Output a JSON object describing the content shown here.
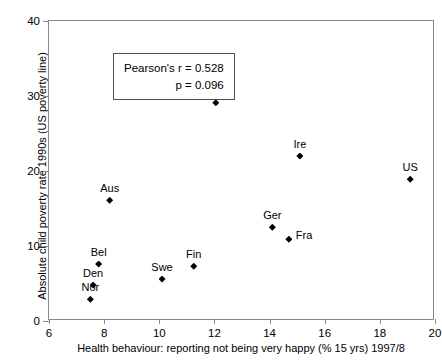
{
  "chart_data": {
    "type": "scatter",
    "title": "",
    "xlabel": "Health behaviour:  reporting not being very happy  (% 15 yrs) 1997/8",
    "ylabel": "Absolute child poverty rate 1990s (US poverty line)",
    "xlim": [
      6,
      20
    ],
    "ylim": [
      0,
      40
    ],
    "xticks": [
      6,
      8,
      10,
      12,
      14,
      16,
      18,
      20
    ],
    "yticks": [
      0,
      10,
      20,
      30,
      40
    ],
    "grid": false,
    "legend": "none",
    "marker": "diamond",
    "marker_color": "#000000",
    "points": [
      {
        "label": "Nor",
        "x": 7.5,
        "y": 2.9,
        "label_pos": "above"
      },
      {
        "label": "Den",
        "x": 7.6,
        "y": 4.8,
        "label_pos": "above"
      },
      {
        "label": "Bel",
        "x": 7.8,
        "y": 7.6,
        "label_pos": "above"
      },
      {
        "label": "Aus",
        "x": 8.2,
        "y": 16.1,
        "label_pos": "above"
      },
      {
        "label": "Swe",
        "x": 10.1,
        "y": 5.6,
        "label_pos": "above"
      },
      {
        "label": "Fin",
        "x": 11.25,
        "y": 7.3,
        "label_pos": "above"
      },
      {
        "label": "UK",
        "x": 12.05,
        "y": 29.1,
        "label_pos": "above"
      },
      {
        "label": "Ger",
        "x": 14.1,
        "y": 12.5,
        "label_pos": "above"
      },
      {
        "label": "Fra",
        "x": 14.7,
        "y": 10.9,
        "label_pos": "right"
      },
      {
        "label": "Ire",
        "x": 15.1,
        "y": 22.0,
        "label_pos": "above"
      },
      {
        "label": "US",
        "x": 19.1,
        "y": 18.9,
        "label_pos": "above"
      }
    ],
    "annotations": {
      "stats_box": {
        "line1": "Pearson's r = 0.528",
        "line2": "p = 0.096"
      }
    }
  }
}
